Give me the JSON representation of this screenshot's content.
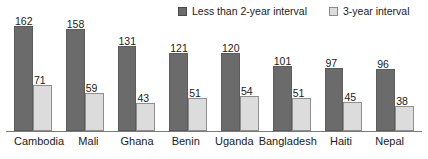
{
  "chart_data": {
    "type": "bar",
    "title": "",
    "subtitle": "",
    "xlabel": "",
    "ylabel": "",
    "ylim": [
      0,
      162
    ],
    "grid": false,
    "legend_position": "top-right",
    "categories": [
      "Cambodia",
      "Mali",
      "Ghana",
      "Benin",
      "Uganda",
      "Bangladesh",
      "Haiti",
      "Nepal"
    ],
    "series": [
      {
        "name": "Less than 2-year interval",
        "color": "#6b6b6b",
        "values": [
          162,
          158,
          131,
          121,
          120,
          101,
          97,
          96
        ]
      },
      {
        "name": "3-year interval",
        "color": "#dcdcdc",
        "values": [
          71,
          59,
          43,
          51,
          54,
          51,
          45,
          38
        ]
      }
    ]
  },
  "legend": {
    "items": [
      {
        "label": "Less than 2-year interval",
        "swatch": "dark-swatch-icon"
      },
      {
        "label": "3-year interval",
        "swatch": "light-swatch-icon"
      }
    ]
  }
}
